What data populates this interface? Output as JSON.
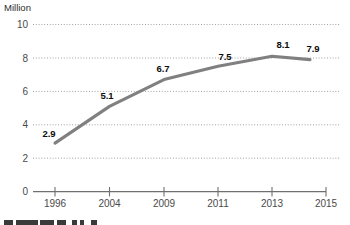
{
  "chart_data": {
    "type": "line",
    "title": "",
    "subtitle": "",
    "xlabel": "",
    "ylabel": "Million",
    "unit_label": "Million",
    "categories": [
      "1996",
      "2004",
      "2009",
      "2011",
      "2013",
      "2015"
    ],
    "x_tick_labels": [
      "1996",
      "2004",
      "2009",
      "2011",
      "2013",
      "2015"
    ],
    "y_tick_labels": [
      "0",
      "2",
      "4",
      "6",
      "8",
      "10"
    ],
    "y_ticks": [
      0,
      2,
      4,
      6,
      8,
      10
    ],
    "ylim": [
      0,
      10
    ],
    "xlim": [
      1996,
      2015
    ],
    "grid": true,
    "grid_axis": "y",
    "legend": false,
    "legend_position": "none",
    "line_color": "#808080",
    "grid_color": "#8c8c8c",
    "axis_color": "#6f6f6f",
    "label_color": "#0d0d0d",
    "x": [
      1996,
      2004,
      2009,
      2011,
      2013,
      2015
    ],
    "values": [
      2.9,
      5.1,
      6.7,
      7.5,
      8.1,
      7.9
    ],
    "point_labels": [
      "2.9",
      "5.1",
      "6.7",
      "7.5",
      "8.1",
      "7.9"
    ],
    "series": [
      {
        "name": "",
        "x": [
          1996,
          2004,
          2009,
          2011,
          2013,
          2015
        ],
        "values": [
          2.9,
          5.1,
          6.7,
          7.5,
          8.1,
          7.9
        ]
      }
    ]
  },
  "footer": {
    "fragment_note": ""
  }
}
